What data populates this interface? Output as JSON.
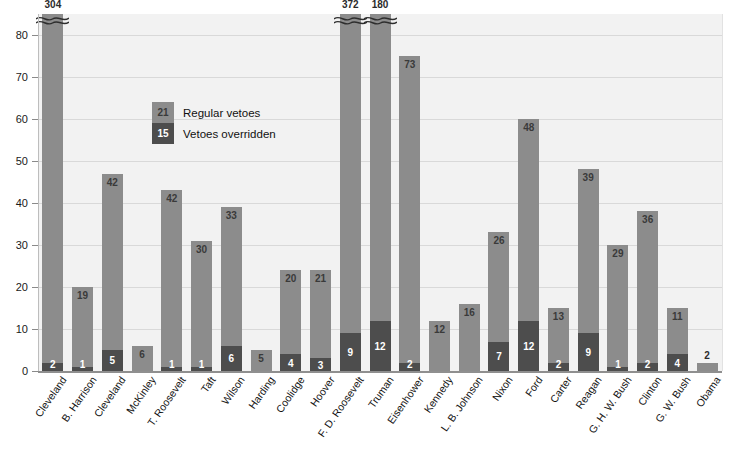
{
  "chart_data": {
    "type": "bar",
    "subtype": "stacked-bar-with-broken-axis",
    "title": "",
    "xlabel": "",
    "ylabel": "",
    "ylim": [
      0,
      85
    ],
    "yticks": [
      0,
      10,
      20,
      30,
      40,
      50,
      60,
      70,
      80
    ],
    "grid": true,
    "legend_position": "inside-upper-left",
    "categories": [
      "Cleveland",
      "B. Harrison",
      "Cleveland",
      "McKinley",
      "T. Roosevelt",
      "Taft",
      "Wilson",
      "Harding",
      "Coolidge",
      "Hoover",
      "F. D. Roosevelt",
      "Truman",
      "Eisenhower",
      "Kennedy",
      "L. B. Johnson",
      "Nixon",
      "Ford",
      "Carter",
      "Reagan",
      "G. H. W. Bush",
      "Clinton",
      "G. W. Bush",
      "Obama"
    ],
    "series": [
      {
        "name": "Regular vetoes",
        "color": "#8c8c8c",
        "values": [
          304,
          19,
          42,
          6,
          42,
          30,
          33,
          5,
          20,
          21,
          372,
          180,
          73,
          12,
          16,
          26,
          48,
          13,
          39,
          29,
          36,
          11,
          2
        ]
      },
      {
        "name": "Vetoes overridden",
        "color": "#4d4d4d",
        "values": [
          2,
          1,
          5,
          0,
          1,
          1,
          6,
          0,
          4,
          3,
          9,
          12,
          2,
          0,
          0,
          7,
          12,
          2,
          9,
          1,
          2,
          4,
          0
        ]
      }
    ],
    "broken_bars": [
      {
        "category": "Cleveland",
        "value": 304
      },
      {
        "category": "F. D. Roosevelt",
        "value": 372
      },
      {
        "category": "Truman",
        "value": 180
      }
    ]
  },
  "legend": {
    "rows": [
      {
        "badge": "21",
        "label": "Regular vetoes",
        "color": "#8c8c8c"
      },
      {
        "badge": "15",
        "label": "Vetoes overridden",
        "color": "#4d4d4d"
      }
    ]
  },
  "axis": {
    "y_tick_labels": [
      "0",
      "10",
      "20",
      "30",
      "40",
      "50",
      "60",
      "70",
      "80"
    ]
  },
  "colors": {
    "regular": "#8c8c8c",
    "overridden": "#4d4d4d",
    "panel": "#f2f2f2",
    "grid": "#d9d9d9",
    "axis": "#8f8f8f"
  }
}
